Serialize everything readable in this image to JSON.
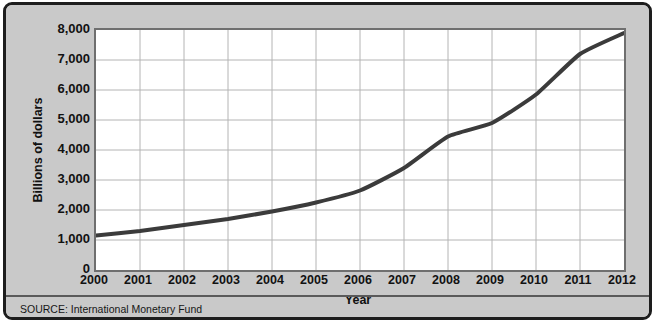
{
  "chart_data": {
    "type": "line",
    "title": "",
    "subtitle": "",
    "xlabel": "Year",
    "ylabel": "Billions of dollars",
    "x": [
      2000,
      2001,
      2002,
      2003,
      2004,
      2005,
      2006,
      2007,
      2008,
      2009,
      2010,
      2011,
      2012
    ],
    "categories": [
      "2000",
      "2001",
      "2002",
      "2003",
      "2004",
      "2005",
      "2006",
      "2007",
      "2008",
      "2009",
      "2010",
      "2011",
      "2012"
    ],
    "series": [
      {
        "name": "Billions of dollars",
        "values": [
          1150,
          1300,
          1500,
          1700,
          1950,
          2250,
          2650,
          3400,
          4450,
          4900,
          5850,
          7200,
          7900
        ],
        "color": "#3b3b3b"
      }
    ],
    "xlim": [
      2000,
      2012
    ],
    "ylim": [
      0,
      8000
    ],
    "ytick_values": [
      0,
      1000,
      2000,
      3000,
      4000,
      5000,
      6000,
      7000,
      8000
    ],
    "ytick_labels": [
      "0",
      "1,000",
      "2,000",
      "3,000",
      "4,000",
      "5,000",
      "6,000",
      "7,000",
      "8,000"
    ],
    "xtick_labels": [
      "2000",
      "2001",
      "2002",
      "2003",
      "2004",
      "2005",
      "2006",
      "2007",
      "2008",
      "2009",
      "2010",
      "2011",
      "2012"
    ],
    "grid": true,
    "grid_color": "#b4b4b4",
    "legend": "none",
    "plot_background": "#ffffff",
    "figure_background": "#c9c9c9",
    "border_color": "#1d1d1d",
    "line_width": 4
  },
  "footer": {
    "source_text": "SOURCE: International Monetary Fund"
  }
}
